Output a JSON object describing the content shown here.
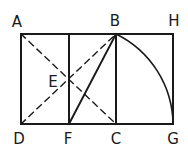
{
  "diagram": {
    "stroke_color": "#1a1a1a",
    "background": "#ffffff",
    "points": {
      "A": {
        "label": "A",
        "x": 21,
        "y": 34,
        "lx": 17,
        "ly": 22
      },
      "B": {
        "label": "B",
        "x": 116,
        "y": 34,
        "lx": 115,
        "ly": 21
      },
      "H": {
        "label": "H",
        "x": 173,
        "y": 34,
        "lx": 174,
        "ly": 21
      },
      "D": {
        "label": "D",
        "x": 21,
        "y": 124,
        "lx": 19,
        "ly": 139
      },
      "F": {
        "label": "F",
        "x": 69,
        "y": 124,
        "lx": 68,
        "ly": 139
      },
      "C": {
        "label": "C",
        "x": 116,
        "y": 124,
        "lx": 116,
        "ly": 139
      },
      "G": {
        "label": "G",
        "x": 173,
        "y": 124,
        "lx": 173,
        "ly": 139
      },
      "E": {
        "label": "E",
        "x": 69,
        "y": 79,
        "lx": 53,
        "ly": 82
      }
    },
    "solid_lines": [
      [
        "A",
        "H"
      ],
      [
        "D",
        "G"
      ],
      [
        "A",
        "D"
      ],
      [
        "H",
        "G"
      ],
      [
        "B",
        "C"
      ],
      [
        "F",
        "B"
      ]
    ],
    "vertical_mid": {
      "x": 69,
      "y1": 34,
      "y2": 124
    },
    "dashed_lines": [
      [
        "A",
        "C"
      ],
      [
        "D",
        "B"
      ]
    ],
    "arc": {
      "center": "F",
      "from": "B",
      "to": "G"
    }
  }
}
